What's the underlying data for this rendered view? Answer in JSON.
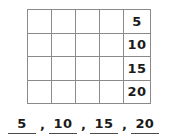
{
  "worksheet": {
    "title": "Skip counting by fives grid",
    "background_color": "#ffffff",
    "ink_color": "#1b1b1b",
    "grid_line_color": "#8a8a8a",
    "rule_color": "#4a4a4a"
  },
  "grid": {
    "columns": 5,
    "rows": 4,
    "number_column_index": 4,
    "rows_data": [
      {
        "blanks": [
          "",
          "",
          "",
          ""
        ],
        "value": "5"
      },
      {
        "blanks": [
          "",
          "",
          "",
          ""
        ],
        "value": "10"
      },
      {
        "blanks": [
          "",
          "",
          "",
          ""
        ],
        "value": "15"
      },
      {
        "blanks": [
          "",
          "",
          "",
          ""
        ],
        "value": "20"
      }
    ]
  },
  "answers": {
    "separator": ",",
    "items": [
      {
        "value": "5"
      },
      {
        "value": "10"
      },
      {
        "value": "15"
      },
      {
        "value": "20"
      }
    ]
  }
}
